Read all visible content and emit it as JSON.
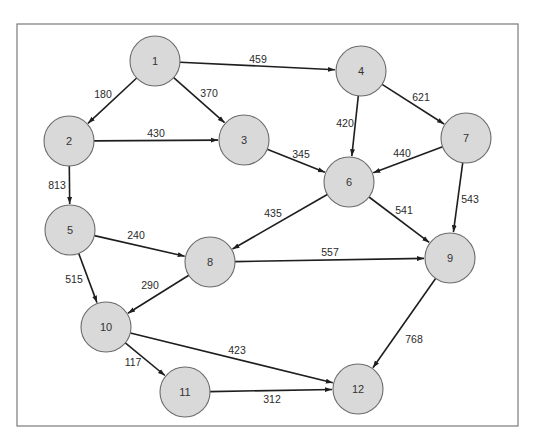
{
  "diagram": {
    "type": "directed-weighted-graph",
    "frame": {
      "x": 17,
      "y": 24,
      "width": 501,
      "height": 402,
      "stroke": "#7a7a7a"
    },
    "style": {
      "node_fill": "#d9d9d9",
      "node_stroke": "#6b6b6b",
      "edge_color": "#1e1e1e",
      "node_radius": 25
    },
    "nodes": [
      {
        "id": "1",
        "label": "1",
        "x": 155,
        "y": 61
      },
      {
        "id": "2",
        "label": "2",
        "x": 69,
        "y": 141
      },
      {
        "id": "3",
        "label": "3",
        "x": 244,
        "y": 140
      },
      {
        "id": "4",
        "label": "4",
        "x": 361,
        "y": 71
      },
      {
        "id": "5",
        "label": "5",
        "x": 70,
        "y": 230
      },
      {
        "id": "6",
        "label": "6",
        "x": 349,
        "y": 182
      },
      {
        "id": "7",
        "label": "7",
        "x": 466,
        "y": 138
      },
      {
        "id": "8",
        "label": "8",
        "x": 210,
        "y": 262
      },
      {
        "id": "9",
        "label": "9",
        "x": 450,
        "y": 258
      },
      {
        "id": "10",
        "label": "10",
        "x": 106,
        "y": 327
      },
      {
        "id": "11",
        "label": "11",
        "x": 185,
        "y": 392
      },
      {
        "id": "12",
        "label": "12",
        "x": 358,
        "y": 389
      }
    ],
    "edges": [
      {
        "from": "1",
        "to": "2",
        "weight": "180",
        "lx": 103,
        "ly": 94
      },
      {
        "from": "1",
        "to": "3",
        "weight": "370",
        "lx": 209,
        "ly": 93
      },
      {
        "from": "1",
        "to": "4",
        "weight": "459",
        "lx": 258,
        "ly": 59
      },
      {
        "from": "2",
        "to": "3",
        "weight": "430",
        "lx": 156,
        "ly": 133
      },
      {
        "from": "2",
        "to": "5",
        "weight": "813",
        "lx": 57,
        "ly": 185
      },
      {
        "from": "3",
        "to": "6",
        "weight": "345",
        "lx": 301,
        "ly": 154
      },
      {
        "from": "4",
        "to": "6",
        "weight": "420",
        "lx": 345,
        "ly": 123
      },
      {
        "from": "4",
        "to": "7",
        "weight": "621",
        "lx": 421,
        "ly": 97
      },
      {
        "from": "7",
        "to": "6",
        "weight": "440",
        "lx": 402,
        "ly": 153
      },
      {
        "from": "7",
        "to": "9",
        "weight": "543",
        "lx": 470,
        "ly": 199
      },
      {
        "from": "6",
        "to": "8",
        "weight": "435",
        "lx": 273,
        "ly": 213
      },
      {
        "from": "6",
        "to": "9",
        "weight": "541",
        "lx": 404,
        "ly": 210
      },
      {
        "from": "5",
        "to": "8",
        "weight": "240",
        "lx": 136,
        "ly": 235
      },
      {
        "from": "5",
        "to": "10",
        "weight": "515",
        "lx": 74,
        "ly": 279
      },
      {
        "from": "8",
        "to": "9",
        "weight": "557",
        "lx": 330,
        "ly": 252
      },
      {
        "from": "8",
        "to": "10",
        "weight": "290",
        "lx": 150,
        "ly": 285
      },
      {
        "from": "9",
        "to": "12",
        "weight": "768",
        "lx": 414,
        "ly": 339
      },
      {
        "from": "10",
        "to": "11",
        "weight": "117",
        "lx": 133,
        "ly": 362
      },
      {
        "from": "10",
        "to": "12",
        "weight": "423",
        "lx": 237,
        "ly": 350
      },
      {
        "from": "11",
        "to": "12",
        "weight": "312",
        "lx": 272,
        "ly": 399
      }
    ]
  }
}
